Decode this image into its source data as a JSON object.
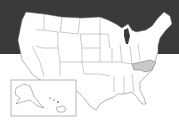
{
  "map": {
    "title": "United States map",
    "background_top_color": "#3a3a3a",
    "background_bottom_color": "#ffffff",
    "state_fill": "#ffffff",
    "highlight_fill": "#c8c8c8",
    "highlighted_state": "North Carolina",
    "inset": "Alaska and Hawaii"
  }
}
